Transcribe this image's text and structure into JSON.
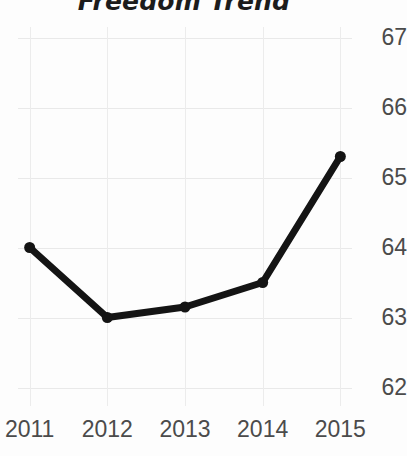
{
  "chart_data": {
    "type": "line",
    "title": "Freedom Trend",
    "xlabel": "",
    "ylabel": "",
    "categories": [
      "2011",
      "2012",
      "2013",
      "2014",
      "2015"
    ],
    "x": [
      2011,
      2012,
      2013,
      2014,
      2015
    ],
    "values": [
      64.0,
      63.0,
      63.15,
      63.5,
      65.3
    ],
    "series": [
      {
        "name": "Freedom Trend",
        "values": [
          64.0,
          63.0,
          63.15,
          63.5,
          65.3
        ]
      }
    ],
    "ylim": [
      61.85,
      67.15
    ],
    "xlim": [
      2010.85,
      2015.15
    ],
    "ytick_labels": [
      "67",
      "66",
      "65",
      "64",
      "63",
      "62"
    ],
    "ytick_values": [
      67,
      66,
      65,
      64,
      63,
      62
    ],
    "xtick_labels": [
      "2011",
      "2012",
      "2013",
      "2014",
      "2015"
    ],
    "grid": true,
    "grid_axis": "both",
    "legend": false,
    "legend_position": "none",
    "yaxis_position": "right",
    "marker": "circle",
    "line_color": "#141414",
    "grid_color": "#e9e9e9",
    "tick_color": "#4b4b4b",
    "background_color": "#fdfdfd",
    "line_width": 7,
    "marker_size": 11
  }
}
